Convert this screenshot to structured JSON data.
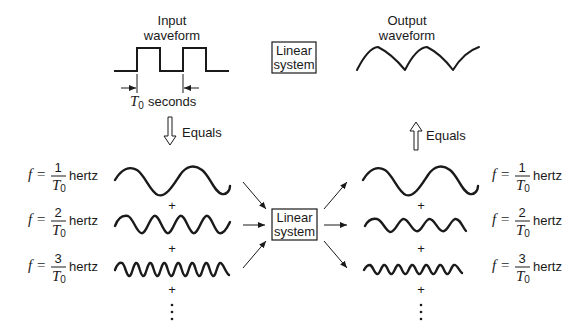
{
  "input": {
    "title_line1": "Input",
    "title_line2": "waveform",
    "period_symbol": "T",
    "period_subscript": "0",
    "period_unit": "seconds"
  },
  "output": {
    "title_line1": "Output",
    "title_line2": "waveform"
  },
  "system_top": {
    "line1": "Linear",
    "line2": "system"
  },
  "system_middle": {
    "line1": "Linear",
    "line2": "system"
  },
  "equals_down": {
    "label": "Equals",
    "direction": "down"
  },
  "equals_up": {
    "label": "Equals",
    "direction": "up"
  },
  "plus": "+",
  "ellipsis": "⋮",
  "harmonics_left": [
    {
      "f_symbol": "f =",
      "numerator": "1",
      "denominator": "T",
      "denominator_sub": "0",
      "unit": "hertz",
      "cycles": 2
    },
    {
      "f_symbol": "f =",
      "numerator": "2",
      "denominator": "T",
      "denominator_sub": "0",
      "unit": "hertz",
      "cycles": 4
    },
    {
      "f_symbol": "f =",
      "numerator": "3",
      "denominator": "T",
      "denominator_sub": "0",
      "unit": "hertz",
      "cycles": 8
    }
  ],
  "harmonics_right": [
    {
      "f_symbol": "f =",
      "numerator": "1",
      "denominator": "T",
      "denominator_sub": "0",
      "unit": "hertz",
      "cycles": 2
    },
    {
      "f_symbol": "f =",
      "numerator": "2",
      "denominator": "T",
      "denominator_sub": "0",
      "unit": "hertz",
      "cycles": 4
    },
    {
      "f_symbol": "f =",
      "numerator": "3",
      "denominator": "T",
      "denominator_sub": "0",
      "unit": "hertz",
      "cycles": 8
    }
  ]
}
